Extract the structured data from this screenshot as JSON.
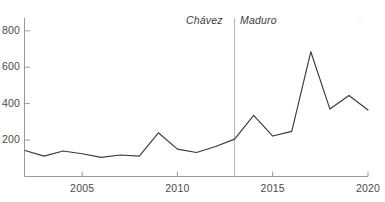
{
  "chart_data": {
    "type": "line",
    "title": "",
    "xlabel": "",
    "ylabel": "",
    "x": [
      2002,
      2003,
      2004,
      2005,
      2006,
      2007,
      2008,
      2009,
      2010,
      2011,
      2012,
      2013,
      2014,
      2015,
      2016,
      2017,
      2018,
      2019,
      2020
    ],
    "values": [
      143,
      112,
      140,
      125,
      105,
      118,
      112,
      240,
      150,
      132,
      165,
      205,
      335,
      222,
      248,
      685,
      370,
      445,
      365
    ],
    "series": [
      {
        "name": "",
        "values": [
          143,
          112,
          140,
          125,
          105,
          118,
          112,
          240,
          150,
          132,
          165,
          205,
          335,
          222,
          248,
          685,
          370,
          445,
          365
        ]
      }
    ],
    "xlim": [
      2002,
      2020
    ],
    "ylim": [
      0,
      870
    ],
    "x_ticks": [
      2005,
      2010,
      2015,
      2020
    ],
    "x_tick_labels": [
      "2005",
      "2010",
      "2015",
      "2020"
    ],
    "y_ticks": [
      200,
      400,
      600,
      800
    ],
    "y_tick_labels": [
      "200",
      "400",
      "600",
      "800"
    ],
    "grid": false,
    "legend": "none",
    "line_color": "#3a3a3a",
    "axis_color": "#9a9a9a",
    "annotations": [
      {
        "label": "Chávez",
        "kind": "era-left",
        "x": 2013
      },
      {
        "label": "Maduro",
        "kind": "era-right",
        "x": 2013
      }
    ],
    "vertical_rule": {
      "x": 2013,
      "color": "#b5b5b5"
    }
  },
  "axes": {
    "y_labels": [
      "800",
      "600",
      "400",
      "200"
    ],
    "x_labels": [
      "2005",
      "2010",
      "2015",
      "2020"
    ]
  },
  "annotations": {
    "chavez": "Chávez",
    "maduro": "Maduro"
  }
}
